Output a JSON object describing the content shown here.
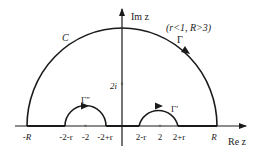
{
  "diagram": {
    "axes": {
      "imag_label": "Im z",
      "real_label": "Re z"
    },
    "condition_label": "(r<1, R>3)",
    "contours": {
      "big_arc_label": "C",
      "gamma_label": "Γ",
      "gamma_prime_label": "Γ′",
      "gamma_double_prime_label": "Γ″"
    },
    "real_axis_ticks": [
      "-R",
      "-2-r",
      "-2",
      "-2+r",
      "2-r",
      "2",
      "2+r",
      "R"
    ],
    "imag_marker_label": "2i",
    "colors": {
      "stroke": "#1a1a1a",
      "background": "#ffffff"
    }
  }
}
